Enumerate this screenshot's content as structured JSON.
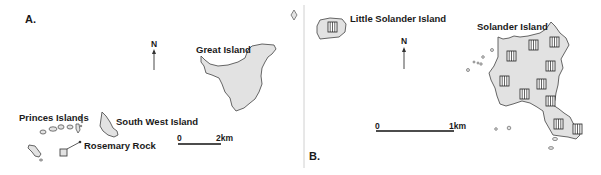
{
  "panels": [
    {
      "id": "A",
      "label": "A.",
      "islands": [
        "Great Island",
        "South West Island",
        "Princes Islands",
        "Rosemary Rock"
      ],
      "north_label": "N",
      "scale": {
        "start": "0",
        "end": "2km"
      }
    },
    {
      "id": "B",
      "label": "B.",
      "islands": [
        "Little Solander Island",
        "Solander Island"
      ],
      "north_label": "N",
      "scale": {
        "start": "0",
        "end": "1km"
      }
    }
  ],
  "colors": {
    "land": "#e2e2e2",
    "outline": "#555555",
    "text": "#1a1a1a"
  }
}
